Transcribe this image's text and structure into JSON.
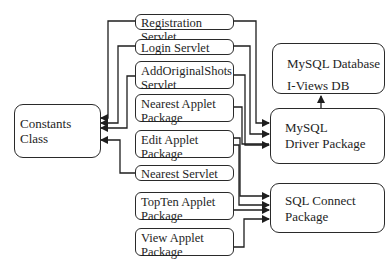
{
  "diagram": {
    "type": "architecture-block-diagram",
    "nodes": {
      "constants": {
        "label": "Constants Class"
      },
      "registration_servlet": {
        "label": "Registration Servlet"
      },
      "login_servlet": {
        "label": "Login Servlet"
      },
      "add_original_shots_servlet": {
        "line1": "AddOriginalShots",
        "line2": "Servlet"
      },
      "nearest_applet": {
        "line1": "Nearest Applet",
        "line2": "Package"
      },
      "edit_applet": {
        "line1": "Edit Applet",
        "line2": "Package"
      },
      "nearest_servlet": {
        "label": "Nearest Servlet"
      },
      "topten_applet": {
        "line1": "TopTen Applet",
        "line2": "Package"
      },
      "view_applet": {
        "line1": "View Applet",
        "line2": "Package"
      },
      "mysql_database": {
        "line1": "MySQL Database",
        "line2": "I-Views DB"
      },
      "mysql_driver": {
        "line1": "MySQL",
        "line2": "Driver Package"
      },
      "sql_connect": {
        "line1": "SQL Connect",
        "line2": "Package"
      }
    },
    "edges": [
      {
        "from": "Registration Servlet",
        "to": "Constants Class"
      },
      {
        "from": "Login Servlet",
        "to": "Constants Class"
      },
      {
        "from": "AddOriginalShots Servlet",
        "to": "Constants Class"
      },
      {
        "from": "Nearest Servlet",
        "to": "Constants Class"
      },
      {
        "from": "Registration Servlet",
        "to": "MySQL Driver Package"
      },
      {
        "from": "Login Servlet",
        "to": "MySQL Driver Package"
      },
      {
        "from": "AddOriginalShots Servlet",
        "to": "MySQL Driver Package"
      },
      {
        "from": "Nearest Applet Package",
        "to": "MySQL Driver Package"
      },
      {
        "from": "Edit Applet Package",
        "to": "SQL Connect Package"
      },
      {
        "from": "Nearest Servlet",
        "to": "SQL Connect Package"
      },
      {
        "from": "TopTen Applet Package",
        "to": "SQL Connect Package"
      },
      {
        "from": "View Applet Package",
        "to": "SQL Connect Package"
      },
      {
        "from": "SQL Connect Package",
        "to": "MySQL Driver Package"
      },
      {
        "from": "MySQL Driver Package",
        "to": "MySQL Database"
      }
    ]
  }
}
